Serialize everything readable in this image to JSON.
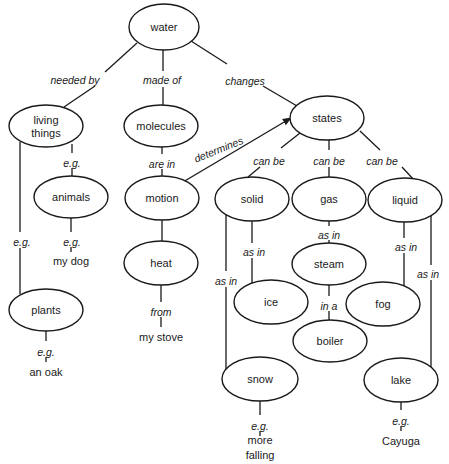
{
  "diagram": {
    "colors": {
      "stroke": "#1a1a1a",
      "background": "#ffffff"
    },
    "nodes": [
      {
        "id": "water",
        "label": [
          "water"
        ],
        "cx": 164,
        "cy": 27,
        "rx": 35,
        "ry": 23
      },
      {
        "id": "living",
        "label": [
          "living",
          "things"
        ],
        "cx": 46,
        "cy": 126,
        "rx": 37,
        "ry": 21
      },
      {
        "id": "molecules",
        "label": [
          "molecules"
        ],
        "cx": 161,
        "cy": 126,
        "rx": 37,
        "ry": 21
      },
      {
        "id": "states",
        "label": [
          "states"
        ],
        "cx": 327,
        "cy": 118,
        "rx": 37,
        "ry": 22
      },
      {
        "id": "animals",
        "label": [
          "animals"
        ],
        "cx": 71,
        "cy": 197,
        "rx": 37,
        "ry": 21
      },
      {
        "id": "motion",
        "label": [
          "motion"
        ],
        "cx": 162,
        "cy": 198,
        "rx": 37,
        "ry": 22
      },
      {
        "id": "solid",
        "label": [
          "solid"
        ],
        "cx": 252,
        "cy": 199,
        "rx": 37,
        "ry": 22
      },
      {
        "id": "gas",
        "label": [
          "gas"
        ],
        "cx": 329,
        "cy": 199,
        "rx": 37,
        "ry": 22
      },
      {
        "id": "liquid",
        "label": [
          "liquid"
        ],
        "cx": 405,
        "cy": 200,
        "rx": 37,
        "ry": 22
      },
      {
        "id": "heat",
        "label": [
          "heat"
        ],
        "cx": 161,
        "cy": 263,
        "rx": 37,
        "ry": 22
      },
      {
        "id": "steam",
        "label": [
          "steam"
        ],
        "cx": 329,
        "cy": 264,
        "rx": 37,
        "ry": 21
      },
      {
        "id": "ice",
        "label": [
          "ice"
        ],
        "cx": 271,
        "cy": 302,
        "rx": 37,
        "ry": 22
      },
      {
        "id": "fog",
        "label": [
          "fog"
        ],
        "cx": 383,
        "cy": 304,
        "rx": 37,
        "ry": 22
      },
      {
        "id": "plants",
        "label": [
          "plants"
        ],
        "cx": 46,
        "cy": 310,
        "rx": 37,
        "ry": 21
      },
      {
        "id": "boiler",
        "label": [
          "boiler"
        ],
        "cx": 330,
        "cy": 341,
        "rx": 37,
        "ry": 21
      },
      {
        "id": "snow",
        "label": [
          "snow"
        ],
        "cx": 260,
        "cy": 379,
        "rx": 38,
        "ry": 22
      },
      {
        "id": "lake",
        "label": [
          "lake"
        ],
        "cx": 401,
        "cy": 380,
        "rx": 37,
        "ry": 22
      }
    ],
    "plain_terms": [
      {
        "id": "my-dog",
        "label": [
          "my dog"
        ],
        "x": 71,
        "y": 261
      },
      {
        "id": "my-stove",
        "label": [
          "my stove"
        ],
        "x": 161,
        "y": 337
      },
      {
        "id": "an-oak",
        "label": [
          "an oak"
        ],
        "x": 46,
        "y": 372
      },
      {
        "id": "more-falling",
        "label": [
          "more",
          "falling"
        ],
        "x": 260,
        "y": 447
      },
      {
        "id": "cayuga",
        "label": [
          "Cayuga"
        ],
        "x": 401,
        "y": 441
      }
    ],
    "link_labels": [
      {
        "text": "needed by",
        "x": 75,
        "y": 80,
        "rotate": 0
      },
      {
        "text": "made of",
        "x": 162,
        "y": 80,
        "rotate": 0
      },
      {
        "text": "changes",
        "x": 245,
        "y": 81,
        "rotate": 0
      },
      {
        "text": "e.g.",
        "x": 72,
        "y": 163,
        "rotate": 0
      },
      {
        "text": "are in",
        "x": 162,
        "y": 164,
        "rotate": 0
      },
      {
        "text": "determines",
        "x": 220,
        "y": 149,
        "rotate": -22
      },
      {
        "text": "can be",
        "x": 269,
        "y": 161,
        "rotate": 0
      },
      {
        "text": "can be",
        "x": 329,
        "y": 161,
        "rotate": 0
      },
      {
        "text": "can be",
        "x": 382,
        "y": 161,
        "rotate": 0
      },
      {
        "text": "e.g.",
        "x": 22,
        "y": 242,
        "rotate": 0
      },
      {
        "text": "e.g.",
        "x": 72,
        "y": 242,
        "rotate": 0
      },
      {
        "text": "as in",
        "x": 329,
        "y": 235,
        "rotate": 0
      },
      {
        "text": "as in",
        "x": 254,
        "y": 252,
        "rotate": 0
      },
      {
        "text": "as in",
        "x": 406,
        "y": 247,
        "rotate": 0
      },
      {
        "text": "as in",
        "x": 226,
        "y": 281,
        "rotate": 0
      },
      {
        "text": "as in",
        "x": 428,
        "y": 274,
        "rotate": 0
      },
      {
        "text": "from",
        "x": 161,
        "y": 312,
        "rotate": 0
      },
      {
        "text": "in a",
        "x": 329,
        "y": 306,
        "rotate": 0
      },
      {
        "text": "e.g.",
        "x": 46,
        "y": 352,
        "rotate": 0
      },
      {
        "text": "e.g.",
        "x": 260,
        "y": 426,
        "rotate": 0
      },
      {
        "text": "e.g.",
        "x": 401,
        "y": 421,
        "rotate": 0
      }
    ],
    "edges": [
      {
        "from": "water",
        "to": "living",
        "points": [
          [
            137,
            43
          ],
          [
            105,
            72
          ]
        ]
      },
      {
        "from": "water",
        "to": "living",
        "points": [
          [
            95,
            86
          ],
          [
            64,
            107
          ]
        ]
      },
      {
        "from": "water",
        "to": "molecules",
        "points": [
          [
            163,
            50
          ],
          [
            163,
            71
          ]
        ]
      },
      {
        "from": "water",
        "to": "molecules",
        "points": [
          [
            163,
            87
          ],
          [
            163,
            105
          ]
        ]
      },
      {
        "from": "water",
        "to": "states",
        "points": [
          [
            191,
            41
          ],
          [
            227,
            64
          ]
        ]
      },
      {
        "from": "water",
        "to": "states",
        "points": [
          [
            263,
            86
          ],
          [
            297,
            106
          ]
        ]
      },
      {
        "from": "living",
        "to": "animals",
        "points": [
          [
            72,
            144
          ],
          [
            72,
            153
          ]
        ]
      },
      {
        "from": "living",
        "to": "animals",
        "points": [
          [
            72,
            168
          ],
          [
            72,
            176
          ]
        ]
      },
      {
        "from": "living",
        "to": "plants",
        "points": [
          [
            20,
            142
          ],
          [
            20,
            232
          ]
        ]
      },
      {
        "from": "living",
        "to": "plants",
        "points": [
          [
            20,
            248
          ],
          [
            20,
            294
          ]
        ]
      },
      {
        "from": "molecules",
        "to": "motion",
        "points": [
          [
            162,
            147
          ],
          [
            162,
            154
          ]
        ]
      },
      {
        "from": "molecules",
        "to": "motion",
        "points": [
          [
            162,
            169
          ],
          [
            162,
            176
          ]
        ]
      },
      {
        "from": "motion",
        "to": "states",
        "points": [
          [
            183,
            182
          ],
          [
            291,
            118
          ]
        ],
        "arrow": true
      },
      {
        "from": "states",
        "to": "solid",
        "points": [
          [
            300,
            133
          ],
          [
            281,
            148
          ]
        ]
      },
      {
        "from": "states",
        "to": "solid",
        "points": [
          [
            260,
            167
          ],
          [
            248,
            177
          ]
        ]
      },
      {
        "from": "states",
        "to": "gas",
        "points": [
          [
            329,
            140
          ],
          [
            329,
            150
          ]
        ]
      },
      {
        "from": "states",
        "to": "gas",
        "points": [
          [
            329,
            167
          ],
          [
            329,
            177
          ]
        ]
      },
      {
        "from": "states",
        "to": "liquid",
        "points": [
          [
            360,
            131
          ],
          [
            380,
            150
          ]
        ]
      },
      {
        "from": "states",
        "to": "liquid",
        "points": [
          [
            402,
            167
          ],
          [
            414,
            180
          ]
        ]
      },
      {
        "from": "animals",
        "to": "my-dog",
        "points": [
          [
            71,
            218
          ],
          [
            71,
            232
          ]
        ]
      },
      {
        "from": "animals",
        "to": "my-dog",
        "points": [
          [
            71,
            247
          ],
          [
            71,
            252
          ]
        ]
      },
      {
        "from": "motion",
        "to": "heat",
        "points": [
          [
            162,
            220
          ],
          [
            162,
            241
          ]
        ]
      },
      {
        "from": "gas",
        "to": "steam",
        "points": [
          [
            329,
            221
          ],
          [
            329,
            226
          ]
        ]
      },
      {
        "from": "gas",
        "to": "steam",
        "points": [
          [
            329,
            240
          ],
          [
            329,
            243
          ]
        ]
      },
      {
        "from": "solid",
        "to": "ice",
        "points": [
          [
            252,
            221
          ],
          [
            252,
            243
          ]
        ]
      },
      {
        "from": "solid",
        "to": "ice",
        "points": [
          [
            252,
            258
          ],
          [
            252,
            286
          ]
        ]
      },
      {
        "from": "solid",
        "to": "snow",
        "points": [
          [
            226,
            215
          ],
          [
            226,
            271
          ]
        ]
      },
      {
        "from": "solid",
        "to": "snow",
        "points": [
          [
            226,
            287
          ],
          [
            226,
            371
          ]
        ]
      },
      {
        "from": "liquid",
        "to": "fog",
        "points": [
          [
            404,
            222
          ],
          [
            404,
            238
          ]
        ]
      },
      {
        "from": "liquid",
        "to": "fog",
        "points": [
          [
            404,
            253
          ],
          [
            404,
            287
          ]
        ]
      },
      {
        "from": "liquid",
        "to": "lake",
        "points": [
          [
            431,
            215
          ],
          [
            431,
            265
          ]
        ]
      },
      {
        "from": "liquid",
        "to": "lake",
        "points": [
          [
            431,
            280
          ],
          [
            431,
            370
          ]
        ]
      },
      {
        "from": "heat",
        "to": "my-stove",
        "points": [
          [
            161,
            285
          ],
          [
            161,
            302
          ]
        ]
      },
      {
        "from": "heat",
        "to": "my-stove",
        "points": [
          [
            161,
            317
          ],
          [
            161,
            327
          ]
        ]
      },
      {
        "from": "steam",
        "to": "boiler",
        "points": [
          [
            329,
            285
          ],
          [
            329,
            296
          ]
        ]
      },
      {
        "from": "steam",
        "to": "boiler",
        "points": [
          [
            329,
            311
          ],
          [
            329,
            320
          ]
        ]
      },
      {
        "from": "plants",
        "to": "an-oak",
        "points": [
          [
            46,
            331
          ],
          [
            46,
            341
          ]
        ]
      },
      {
        "from": "plants",
        "to": "an-oak",
        "points": [
          [
            46,
            357
          ],
          [
            46,
            362
          ]
        ]
      },
      {
        "from": "snow",
        "to": "more-falling",
        "points": [
          [
            260,
            401
          ],
          [
            260,
            415
          ]
        ]
      },
      {
        "from": "snow",
        "to": "more-falling",
        "points": [
          [
            260,
            431
          ],
          [
            260,
            436
          ]
        ]
      },
      {
        "from": "lake",
        "to": "cayuga",
        "points": [
          [
            401,
            402
          ],
          [
            401,
            410
          ]
        ]
      },
      {
        "from": "lake",
        "to": "cayuga",
        "points": [
          [
            401,
            426
          ],
          [
            401,
            431
          ]
        ]
      }
    ]
  }
}
